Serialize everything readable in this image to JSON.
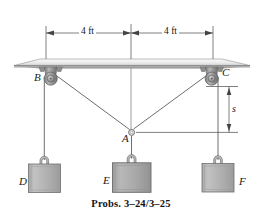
{
  "figure": {
    "caption": "Probs. 3–24/3–25",
    "dimensions": [
      {
        "id": "left-span",
        "label": "4 ft",
        "value": 4,
        "unit": "ft",
        "orientation": "horizontal"
      },
      {
        "id": "right-span",
        "label": "4 ft",
        "value": 4,
        "unit": "ft",
        "orientation": "horizontal"
      },
      {
        "id": "sag",
        "label": "s",
        "value": null,
        "unit": null,
        "orientation": "vertical"
      }
    ],
    "points": [
      {
        "id": "B",
        "label": "B",
        "type": "pulley"
      },
      {
        "id": "C",
        "label": "C",
        "type": "pulley"
      },
      {
        "id": "A",
        "label": "A",
        "type": "ring"
      },
      {
        "id": "D",
        "label": "D",
        "type": "block"
      },
      {
        "id": "E",
        "label": "E",
        "type": "block"
      },
      {
        "id": "F",
        "label": "F",
        "type": "block"
      }
    ],
    "colors": {
      "line": "#6b6b6b",
      "ceiling_light": "#f2f2f2",
      "ceiling_dark": "#9c9c9c",
      "pulley_body": "#9a9a9a",
      "block_fill": "#b4b4b4",
      "block_edge": "#737373",
      "text": "#141414"
    }
  }
}
